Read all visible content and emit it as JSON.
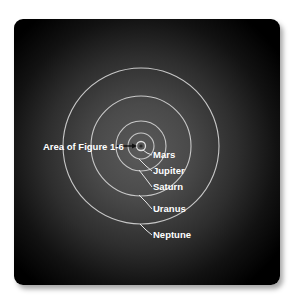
{
  "diagram": {
    "center": {
      "x": 141,
      "y": 146
    },
    "colors": {
      "panel_center": "#5a5a5a",
      "panel_edge": "#000000",
      "orbit": "#c8c8c8",
      "label": "#ffffff"
    },
    "callout": {
      "label": "Area of Figure 1-6",
      "x": 43,
      "y": 149
    },
    "orbits": [
      {
        "name": "Sun",
        "r": 2
      },
      {
        "name": "Mars",
        "r": 4.5
      },
      {
        "name": "Jupiter",
        "r": 13
      },
      {
        "name": "Saturn",
        "r": 25
      },
      {
        "name": "Uranus",
        "r": 50
      },
      {
        "name": "Neptune",
        "r": 78
      }
    ],
    "labels": [
      {
        "name": "Mars",
        "x": 153,
        "y": 158
      },
      {
        "name": "Jupiter",
        "x": 153,
        "y": 174
      },
      {
        "name": "Saturn",
        "x": 153,
        "y": 190
      },
      {
        "name": "Uranus",
        "x": 153,
        "y": 212
      },
      {
        "name": "Neptune",
        "x": 153,
        "y": 238
      }
    ]
  }
}
